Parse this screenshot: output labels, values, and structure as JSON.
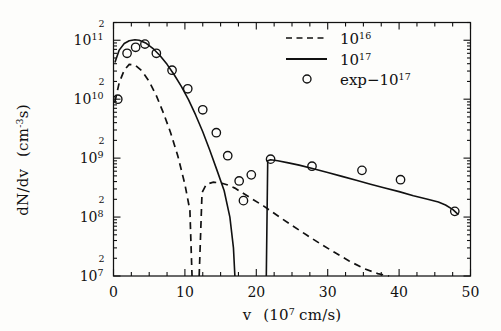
{
  "figure": {
    "name": "velocity-distribution-plot",
    "background": "#fdfdfb",
    "ink_color": "#111111"
  },
  "axes": {
    "x": {
      "label_main": "v",
      "label_paren_open": "(10",
      "label_exp": "7",
      "label_units": "cm/s)",
      "label_full": "v (10^7 cm/s)",
      "min": 0,
      "max": 50,
      "ticks": [
        0,
        10,
        20,
        30,
        40,
        50
      ],
      "tick_labels": [
        "0",
        "10",
        "20",
        "30",
        "40",
        "50"
      ],
      "minor_tick_step": 2.5,
      "scale": "linear"
    },
    "y": {
      "label_main": "dN/dv",
      "label_units": "(cm",
      "label_units_exp": "-3",
      "label_units_tail": "s)",
      "label_full": "dN/dv (cm^-3 s)",
      "min": 10000000.0,
      "max": 200000000000.0,
      "scale": "log",
      "decade_ticks": [
        10000000.0,
        100000000.0,
        1000000000.0,
        10000000000.0,
        100000000000.0
      ],
      "decade_labels": [
        "10",
        "10",
        "10",
        "10",
        "10"
      ],
      "decade_exponents": [
        "7",
        "8",
        "9",
        "10",
        "11"
      ],
      "top_cap_label": "2",
      "top_cap_note": "small 2 marks the 2x10^11 top of frame",
      "minor_decade_marks": [
        "2",
        "2",
        "2",
        "2",
        "2"
      ]
    }
  },
  "legend": {
    "position": "top-right-inside",
    "entries": [
      {
        "key": "dashed-1e16",
        "style": "dashed",
        "label_base": "10",
        "label_exp": "16",
        "label_full": "10^16"
      },
      {
        "key": "solid-1e17",
        "style": "solid",
        "label_base": "10",
        "label_exp": "17",
        "label_full": "10^17"
      },
      {
        "key": "exp-1e17",
        "style": "circle",
        "label_prefix": "exp−10",
        "label_exp": "17",
        "label_full": "exp-10^17"
      }
    ]
  },
  "chart_data": {
    "type": "line",
    "title": "",
    "xlabel": "v (10^7 cm/s)",
    "ylabel": "dN/dv (cm^-3 s)",
    "xlim": [
      0,
      50
    ],
    "ylim": [
      10000000.0,
      200000000000.0
    ],
    "yscale": "log",
    "grid": false,
    "legend_position": "upper right",
    "series": [
      {
        "name": "10^16",
        "style": "dashed",
        "marker": "none",
        "segments": [
          {
            "comment": "low-velocity dashed peak",
            "x": [
              0.2,
              0.8,
              1.5,
              2.2,
              3.0,
              4.0,
              5.0,
              6.0,
              7.0,
              8.0,
              9.0,
              10.0,
              10.7,
              11.0
            ],
            "y": [
              9000000000.0,
              19000000000.0,
              31000000000.0,
              39000000000.0,
              38000000000.0,
              30000000000.0,
              20000000000.0,
              11500000000.0,
              5800000000.0,
              2700000000.0,
              1100000000.0,
              360000000.0,
              130000000.0,
              10000000.0
            ]
          },
          {
            "comment": "dashed secondary shelf and long decaying tail",
            "x": [
              12.0,
              12.4,
              13.0,
              14.0,
              15.0,
              16.0,
              17.0,
              18.0,
              19.5,
              21.0,
              23.0,
              25.0,
              27.0,
              29.0,
              31.0,
              33.0,
              35.0,
              37.0,
              38.6
            ],
            "y": [
              10000000.0,
              260000000.0,
              360000000.0,
              390000000.0,
              380000000.0,
              350000000.0,
              310000000.0,
              260000000.0,
              200000000.0,
              155000000.0,
              105000000.0,
              72000000.0,
              50000000.0,
              35000000.0,
              25000000.0,
              18000000.0,
              13500000.0,
              11000000.0,
              10000000.0
            ]
          }
        ]
      },
      {
        "name": "10^17",
        "style": "solid",
        "marker": "none",
        "segments": [
          {
            "comment": "main low-velocity solid peak falling to cutoff at v=17",
            "x": [
              0.2,
              0.8,
              1.5,
              2.2,
              3.0,
              3.6,
              4.5,
              5.5,
              6.5,
              7.5,
              8.5,
              9.5,
              10.5,
              11.5,
              12.5,
              13.5,
              14.5,
              15.5,
              16.3,
              16.8,
              17.0
            ],
            "y": [
              42000000000.0,
              68000000000.0,
              88000000000.0,
              98000000000.0,
              102000000000.0,
              100000000000.0,
              90000000000.0,
              73000000000.0,
              55000000000.0,
              39000000000.0,
              26000000000.0,
              16500000000.0,
              9800000000.0,
              5400000000.0,
              2800000000.0,
              1350000000.0,
              620000000.0,
              280000000.0,
              100000000.0,
              30000000.0,
              10000000.0
            ]
          },
          {
            "comment": "high-velocity solid plateau and tail",
            "x": [
              21.4,
              21.6,
              22.0,
              23.0,
              24.5,
              26.0,
              28.0,
              30.0,
              32.0,
              34.0,
              36.0,
              38.0,
              40.0,
              42.0,
              44.0,
              45.5,
              46.5,
              47.5,
              48.3
            ],
            "y": [
              10000000.0,
              900000000.0,
              940000000.0,
              900000000.0,
              830000000.0,
              760000000.0,
              660000000.0,
              570000000.0,
              490000000.0,
              420000000.0,
              360000000.0,
              310000000.0,
              270000000.0,
              230000000.0,
              200000000.0,
              180000000.0,
              160000000.0,
              135000000.0,
              110000000.0
            ]
          }
        ]
      },
      {
        "name": "exp-10^17",
        "style": "markers",
        "marker": "open-circle",
        "x": [
          0.6,
          1.9,
          3.1,
          4.4,
          6.0,
          8.2,
          10.4,
          12.5,
          14.4,
          16.0,
          17.6,
          18.2,
          19.3,
          22.0,
          27.8,
          34.8,
          40.2,
          47.8
        ],
        "y": [
          10000000000.0,
          60000000000.0,
          76000000000.0,
          86000000000.0,
          60000000000.0,
          31000000000.0,
          15000000000.0,
          6600000000.0,
          2700000000.0,
          1100000000.0,
          410000000.0,
          190000000.0,
          520000000.0,
          960000000.0,
          730000000.0,
          620000000.0,
          430000000.0,
          125000000.0
        ]
      }
    ]
  }
}
